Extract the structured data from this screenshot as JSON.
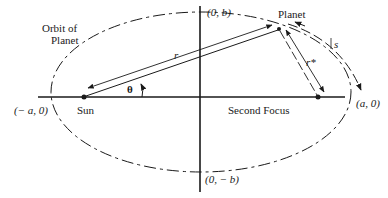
{
  "diagram": {
    "type": "orbital-ellipse",
    "labels": {
      "orbit": [
        "Orbit of",
        "Planet"
      ],
      "planet": "Planet",
      "sun": "Sun",
      "second_focus": "Second Focus",
      "top_vertex": "(0, b)",
      "bottom_vertex": "(0, − b)",
      "left_vertex": "(− a, 0)",
      "right_vertex": "(a, 0)",
      "r": "r",
      "r_star": "r*",
      "theta": "θ",
      "s": "s"
    },
    "colors": {
      "ink": "#1a1a1a",
      "background": "#ffffff"
    }
  }
}
